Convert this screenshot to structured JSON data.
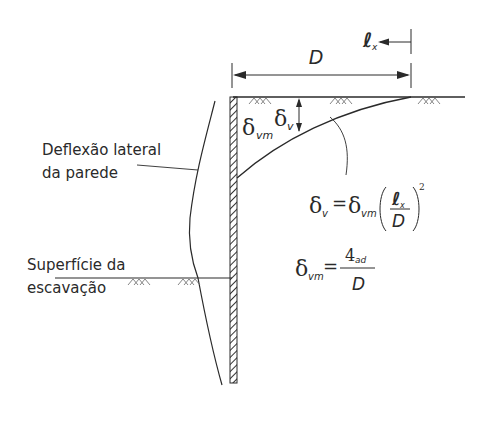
{
  "diagram": {
    "labels": {
      "wall_deflection": [
        "Deflexão lateral",
        "da parede"
      ],
      "excavation_surface": [
        "Superfície da",
        "escavação"
      ],
      "D": "D",
      "lx_symbol": "ℓ",
      "lx_sub": "x",
      "delta": "δ",
      "delta_vm_sub": "vm",
      "delta_v_sub": "v"
    },
    "equations": {
      "eq1": {
        "lhs": "δ",
        "lhs_sub": "v",
        "equals": "=",
        "rhs": "δ",
        "rhs_sub": "vm",
        "num": "ℓ",
        "num_sub": "x",
        "den": "D",
        "power": "2"
      },
      "eq2": {
        "lhs": "δ",
        "lhs_sub": "vm",
        "equals": "=",
        "num": "4",
        "num_sub": "ad",
        "den": "D"
      }
    },
    "colors": {
      "line": "#2a2a2a",
      "hatch": "#333333",
      "soil": "#777777"
    }
  }
}
